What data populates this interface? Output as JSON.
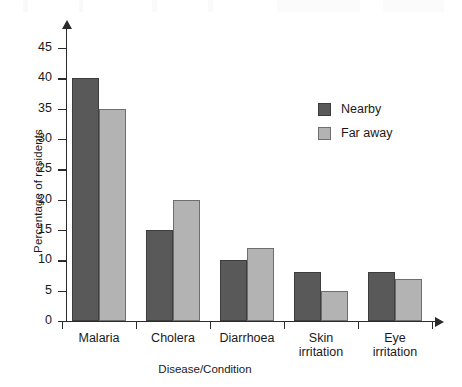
{
  "chart_data": {
    "type": "bar",
    "title": "",
    "xlabel": "Disease/Condition",
    "ylabel": "Percentage of residents",
    "categories": [
      "Malaria",
      "Cholera",
      "Diarrhoea",
      "Skin irritation",
      "Eye irritation"
    ],
    "category_lines": [
      [
        "Malaria"
      ],
      [
        "Cholera"
      ],
      [
        "Diarrhoea"
      ],
      [
        "Skin",
        "irritation"
      ],
      [
        "Eye",
        "irritation"
      ]
    ],
    "series": [
      {
        "name": "Nearby",
        "color": "#595959",
        "values": [
          40,
          15,
          10,
          8,
          8
        ]
      },
      {
        "name": "Far away",
        "color": "#b3b3b3",
        "values": [
          35,
          20,
          12,
          5,
          7
        ]
      }
    ],
    "ylim": [
      0,
      45
    ],
    "ytick_labels": [
      "0",
      "5",
      "10",
      "15",
      "20",
      "25",
      "30",
      "35",
      "40",
      "45"
    ],
    "ytick_values": [
      0,
      5,
      10,
      15,
      20,
      25,
      30,
      35,
      40,
      45
    ],
    "grid": false,
    "legend_position": "upper-right-inside",
    "axis_style": "arrow-ended"
  },
  "legend": {
    "entries": [
      {
        "label": "Nearby",
        "swatch": "nearby-swatch"
      },
      {
        "label": "Far away",
        "swatch": "faraway-swatch"
      }
    ]
  },
  "axes": {
    "y_title": "Percentage of residents",
    "x_title": "Disease/Condition"
  }
}
